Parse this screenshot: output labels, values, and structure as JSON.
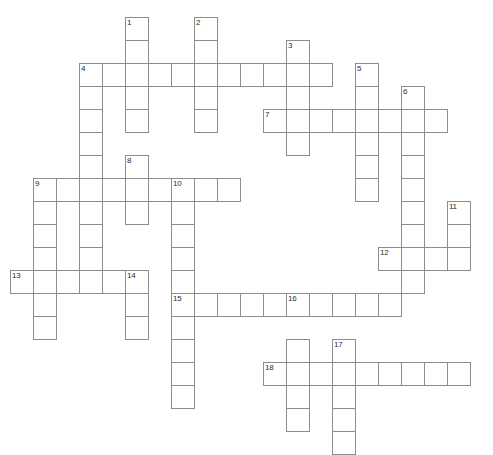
{
  "puzzle": {
    "type": "crossword-grid",
    "title": "Crossword Puzzle Grid",
    "cell_size": 23,
    "origin_x": 10,
    "origin_y": 17,
    "columns": 21,
    "rows": 19,
    "cell_fill": "#ffffff",
    "cell_border": "#8d8d8d",
    "number_color": "#2b2b2b",
    "background": "#ffffff",
    "entries": [
      {
        "number": "1",
        "direction": "down",
        "col": 5,
        "row": 0,
        "length": 5
      },
      {
        "number": "2",
        "direction": "down",
        "col": 8,
        "row": 0,
        "length": 5
      },
      {
        "number": "3",
        "direction": "down",
        "col": 12,
        "row": 1,
        "length": 5
      },
      {
        "number": "4",
        "direction": "across",
        "col": 3,
        "row": 2,
        "length": 11
      },
      {
        "number": "4",
        "direction": "down",
        "col": 3,
        "row": 2,
        "length": 8
      },
      {
        "number": "5",
        "direction": "down",
        "col": 15,
        "row": 2,
        "length": 6
      },
      {
        "number": "6",
        "direction": "down",
        "col": 17,
        "row": 3,
        "length": 6
      },
      {
        "number": "7",
        "direction": "across",
        "col": 11,
        "row": 4,
        "length": 8
      },
      {
        "number": "8",
        "direction": "down",
        "col": 5,
        "row": 6,
        "length": 4
      },
      {
        "number": "9",
        "direction": "across",
        "col": 1,
        "row": 7,
        "length": 9
      },
      {
        "number": "9",
        "direction": "down",
        "col": 1,
        "row": 7,
        "length": 5
      },
      {
        "number": "10",
        "direction": "across",
        "col": 7,
        "row": 7,
        "length": 3
      },
      {
        "number": "10",
        "direction": "down",
        "col": 7,
        "row": 7,
        "length": 10
      },
      {
        "number": "11",
        "direction": "down",
        "col": 19,
        "row": 8,
        "length": 3
      },
      {
        "number": "12",
        "direction": "across",
        "col": 16,
        "row": 10,
        "length": 4
      },
      {
        "number": "13",
        "direction": "across",
        "col": 0,
        "row": 11,
        "length": 6
      },
      {
        "number": "14",
        "direction": "down",
        "col": 5,
        "row": 11,
        "length": 3
      },
      {
        "number": "15",
        "direction": "across",
        "col": 7,
        "row": 12,
        "length": 10
      },
      {
        "number": "16",
        "direction": "down",
        "col": 12,
        "row": 12,
        "length": 6
      },
      {
        "number": "17",
        "direction": "down",
        "col": 14,
        "row": 14,
        "length": 5
      },
      {
        "number": "18",
        "direction": "across",
        "col": 11,
        "row": 15,
        "length": 9
      }
    ],
    "cells": [
      {
        "col": 5,
        "row": 0,
        "number": "1"
      },
      {
        "col": 8,
        "row": 0,
        "number": "2"
      },
      {
        "col": 5,
        "row": 1
      },
      {
        "col": 8,
        "row": 1
      },
      {
        "col": 12,
        "row": 1,
        "number": "3"
      },
      {
        "col": 3,
        "row": 2,
        "number": "4"
      },
      {
        "col": 4,
        "row": 2
      },
      {
        "col": 5,
        "row": 2
      },
      {
        "col": 6,
        "row": 2
      },
      {
        "col": 7,
        "row": 2
      },
      {
        "col": 8,
        "row": 2
      },
      {
        "col": 9,
        "row": 2
      },
      {
        "col": 10,
        "row": 2
      },
      {
        "col": 11,
        "row": 2
      },
      {
        "col": 12,
        "row": 2
      },
      {
        "col": 13,
        "row": 2
      },
      {
        "col": 15,
        "row": 2,
        "number": "5"
      },
      {
        "col": 3,
        "row": 3
      },
      {
        "col": 5,
        "row": 3
      },
      {
        "col": 8,
        "row": 3
      },
      {
        "col": 12,
        "row": 3
      },
      {
        "col": 15,
        "row": 3
      },
      {
        "col": 17,
        "row": 3,
        "number": "6"
      },
      {
        "col": 3,
        "row": 4
      },
      {
        "col": 5,
        "row": 4
      },
      {
        "col": 8,
        "row": 4
      },
      {
        "col": 11,
        "row": 4,
        "number": "7"
      },
      {
        "col": 12,
        "row": 4
      },
      {
        "col": 13,
        "row": 4
      },
      {
        "col": 14,
        "row": 4
      },
      {
        "col": 15,
        "row": 4
      },
      {
        "col": 16,
        "row": 4
      },
      {
        "col": 17,
        "row": 4
      },
      {
        "col": 18,
        "row": 4
      },
      {
        "col": 3,
        "row": 5
      },
      {
        "col": 12,
        "row": 5
      },
      {
        "col": 15,
        "row": 5
      },
      {
        "col": 17,
        "row": 5
      },
      {
        "col": 3,
        "row": 6
      },
      {
        "col": 5,
        "row": 6,
        "number": "8"
      },
      {
        "col": 15,
        "row": 6
      },
      {
        "col": 17,
        "row": 6
      },
      {
        "col": 1,
        "row": 7,
        "number": "9"
      },
      {
        "col": 2,
        "row": 7
      },
      {
        "col": 3,
        "row": 7
      },
      {
        "col": 4,
        "row": 7
      },
      {
        "col": 5,
        "row": 7
      },
      {
        "col": 6,
        "row": 7
      },
      {
        "col": 7,
        "row": 7,
        "number": "10"
      },
      {
        "col": 8,
        "row": 7
      },
      {
        "col": 9,
        "row": 7
      },
      {
        "col": 15,
        "row": 7
      },
      {
        "col": 17,
        "row": 7
      },
      {
        "col": 1,
        "row": 8
      },
      {
        "col": 3,
        "row": 8
      },
      {
        "col": 5,
        "row": 8
      },
      {
        "col": 7,
        "row": 8
      },
      {
        "col": 17,
        "row": 8
      },
      {
        "col": 19,
        "row": 8,
        "number": "11"
      },
      {
        "col": 1,
        "row": 9
      },
      {
        "col": 3,
        "row": 9
      },
      {
        "col": 7,
        "row": 9
      },
      {
        "col": 17,
        "row": 9
      },
      {
        "col": 19,
        "row": 9
      },
      {
        "col": 1,
        "row": 10
      },
      {
        "col": 3,
        "row": 10
      },
      {
        "col": 7,
        "row": 10
      },
      {
        "col": 16,
        "row": 10,
        "number": "12"
      },
      {
        "col": 17,
        "row": 10
      },
      {
        "col": 18,
        "row": 10
      },
      {
        "col": 19,
        "row": 10
      },
      {
        "col": 0,
        "row": 11,
        "number": "13"
      },
      {
        "col": 1,
        "row": 11
      },
      {
        "col": 2,
        "row": 11
      },
      {
        "col": 3,
        "row": 11
      },
      {
        "col": 4,
        "row": 11
      },
      {
        "col": 5,
        "row": 11,
        "number": "14"
      },
      {
        "col": 7,
        "row": 11
      },
      {
        "col": 17,
        "row": 11
      },
      {
        "col": 1,
        "row": 12
      },
      {
        "col": 5,
        "row": 12
      },
      {
        "col": 7,
        "row": 12,
        "number": "15"
      },
      {
        "col": 8,
        "row": 12
      },
      {
        "col": 9,
        "row": 12
      },
      {
        "col": 10,
        "row": 12
      },
      {
        "col": 11,
        "row": 12
      },
      {
        "col": 12,
        "row": 12,
        "number": "16"
      },
      {
        "col": 13,
        "row": 12
      },
      {
        "col": 14,
        "row": 12
      },
      {
        "col": 15,
        "row": 12
      },
      {
        "col": 16,
        "row": 12
      },
      {
        "col": 1,
        "row": 13
      },
      {
        "col": 5,
        "row": 13
      },
      {
        "col": 7,
        "row": 13
      },
      {
        "col": 7,
        "row": 14
      },
      {
        "col": 12,
        "row": 14
      },
      {
        "col": 14,
        "row": 14,
        "number": "17"
      },
      {
        "col": 7,
        "row": 15
      },
      {
        "col": 11,
        "row": 15,
        "number": "18"
      },
      {
        "col": 12,
        "row": 15
      },
      {
        "col": 13,
        "row": 15
      },
      {
        "col": 14,
        "row": 15
      },
      {
        "col": 15,
        "row": 15
      },
      {
        "col": 16,
        "row": 15
      },
      {
        "col": 17,
        "row": 15
      },
      {
        "col": 18,
        "row": 15
      },
      {
        "col": 19,
        "row": 15
      },
      {
        "col": 7,
        "row": 16
      },
      {
        "col": 12,
        "row": 16
      },
      {
        "col": 14,
        "row": 16
      },
      {
        "col": 12,
        "row": 17
      },
      {
        "col": 14,
        "row": 17
      },
      {
        "col": 14,
        "row": 18
      }
    ]
  }
}
